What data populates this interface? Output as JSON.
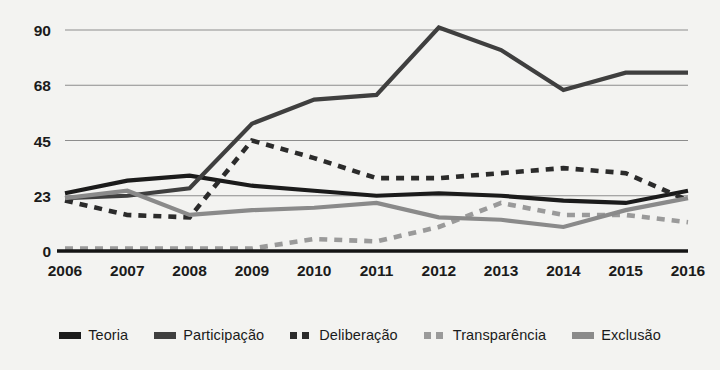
{
  "chart_data": {
    "type": "line",
    "title": "",
    "xlabel": "",
    "ylabel": "",
    "categories": [
      2006,
      2007,
      2008,
      2009,
      2010,
      2011,
      2012,
      2013,
      2014,
      2015,
      2016
    ],
    "ytick_labels": [
      "0",
      "23",
      "45",
      "68",
      "90"
    ],
    "ytick_values": [
      0,
      23,
      45,
      68,
      90
    ],
    "ylim": [
      0,
      90
    ],
    "grid": true,
    "legend_position": "bottom",
    "series": [
      {
        "name": "Teoria",
        "color": "#1b1b1b",
        "style": "solid",
        "values": [
          24,
          29,
          31,
          27,
          25,
          23,
          24,
          23,
          21,
          20,
          25
        ]
      },
      {
        "name": "Participação",
        "color": "#3f3f3f",
        "style": "solid",
        "values": [
          22,
          23,
          26,
          52,
          62,
          64,
          91,
          82,
          66,
          73,
          73
        ]
      },
      {
        "name": "Deliberação",
        "color": "#2b2b2b",
        "style": "dashed",
        "values": [
          21,
          15,
          14,
          45,
          38,
          30,
          30,
          32,
          34,
          32,
          21
        ]
      },
      {
        "name": "Transparência",
        "color": "#9a9a9a",
        "style": "dashed",
        "values": [
          1,
          1,
          1,
          1,
          5,
          4,
          10,
          20,
          15,
          15,
          12
        ]
      },
      {
        "name": "Exclusão",
        "color": "#8a8a8a",
        "style": "solid",
        "values": [
          22,
          25,
          15,
          17,
          18,
          20,
          14,
          13,
          10,
          17,
          22
        ]
      }
    ]
  },
  "legend": {
    "items": [
      {
        "label": "Teoria"
      },
      {
        "label": "Participação"
      },
      {
        "label": "Deliberação"
      },
      {
        "label": "Transparência"
      },
      {
        "label": "Exclusão"
      }
    ]
  }
}
